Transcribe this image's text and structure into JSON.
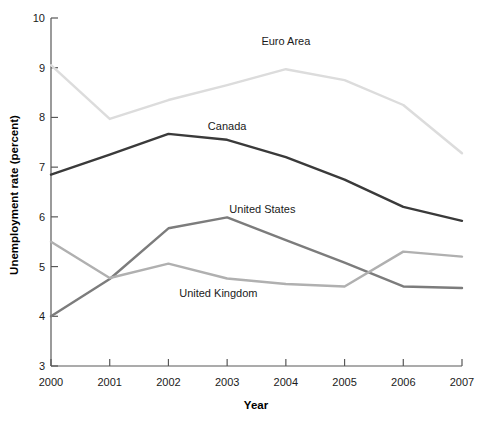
{
  "chart_data": {
    "type": "line",
    "title": "",
    "xlabel": "Year",
    "ylabel": "Unemployment rate (percent)",
    "x": [
      2000,
      2001,
      2002,
      2003,
      2004,
      2005,
      2006,
      2007
    ],
    "categories": [
      "2000",
      "2001",
      "2002",
      "2003",
      "2004",
      "2005",
      "2006",
      "2007"
    ],
    "xlim": [
      2000,
      2007
    ],
    "ylim": [
      3,
      10
    ],
    "y_ticks": [
      3,
      4,
      5,
      6,
      7,
      8,
      9,
      10
    ],
    "y_tick_labels": [
      "3",
      "4",
      "5",
      "6",
      "7",
      "8",
      "9",
      "10"
    ],
    "x_ticks": [
      2000,
      2001,
      2002,
      2003,
      2004,
      2005,
      2006,
      2007
    ],
    "x_tick_labels": [
      "2000",
      "2001",
      "2002",
      "2003",
      "2004",
      "2005",
      "2006",
      "2007"
    ],
    "grid": false,
    "legend": "inline-labels",
    "series": [
      {
        "name": "Euro Area",
        "color": "#dcdcdc",
        "values": [
          9.05,
          7.97,
          8.35,
          8.65,
          8.97,
          8.75,
          8.25,
          7.28
        ],
        "label_x": 2004,
        "label_y": 9.45
      },
      {
        "name": "Canada",
        "color": "#3a3a3a",
        "values": [
          6.85,
          7.25,
          7.67,
          7.55,
          7.2,
          6.75,
          6.2,
          5.92
        ],
        "label_x": 2003,
        "label_y": 7.75
      },
      {
        "name": "United States",
        "color": "#7c7c7c",
        "values": [
          4.0,
          4.75,
          5.77,
          5.99,
          5.53,
          5.08,
          4.6,
          4.57
        ],
        "label_x": 2003.6,
        "label_y": 6.08
      },
      {
        "name": "United Kingdom",
        "color": "#b0b0b0",
        "values": [
          5.5,
          4.77,
          5.06,
          4.76,
          4.65,
          4.6,
          5.3,
          5.2
        ],
        "label_x": 2002.85,
        "label_y": 4.38
      }
    ]
  }
}
